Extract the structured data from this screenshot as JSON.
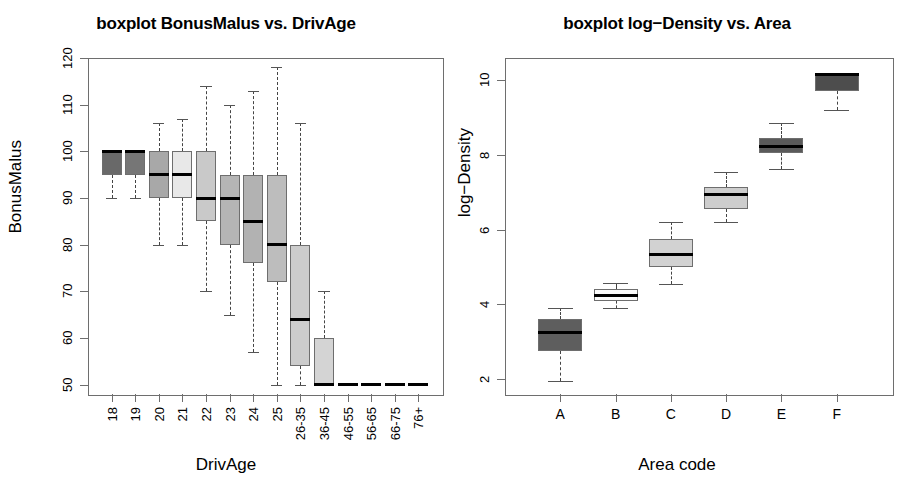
{
  "figure": {
    "panels": [
      "boxplot-bonusmalus-vs-drivage",
      "boxplot-logdensity-vs-area"
    ]
  },
  "chart_data": [
    {
      "type": "box",
      "panel_id": "left",
      "title": "boxplot BonusMalus vs. DrivAge",
      "xlabel": "DrivAge",
      "ylabel": "BonusMalus",
      "ylim": [
        48,
        120
      ],
      "yticks": [
        50,
        60,
        70,
        80,
        90,
        100,
        110,
        120
      ],
      "ytick_labels": [
        "50",
        "60",
        "70",
        "80",
        "90",
        "100",
        "110",
        "120"
      ],
      "grid": false,
      "legend": "none",
      "categories": [
        "18",
        "19",
        "20",
        "21",
        "22",
        "23",
        "24",
        "25",
        "26-35",
        "36-45",
        "46-55",
        "56-65",
        "66-75",
        "76+"
      ],
      "boxes": [
        {
          "category": "18",
          "lower_whisker": 90,
          "q1": 95,
          "median": 100,
          "q3": 100,
          "upper_whisker": 100,
          "fill": "#696969"
        },
        {
          "category": "19",
          "lower_whisker": 90,
          "q1": 95,
          "median": 100,
          "q3": 100,
          "upper_whisker": 100,
          "fill": "#767676"
        },
        {
          "category": "20",
          "lower_whisker": 80,
          "q1": 90,
          "median": 95,
          "q3": 100,
          "upper_whisker": 106,
          "fill": "#a8a8a8"
        },
        {
          "category": "21",
          "lower_whisker": 80,
          "q1": 90,
          "median": 95,
          "q3": 100,
          "upper_whisker": 107,
          "fill": "#e8e8e8"
        },
        {
          "category": "22",
          "lower_whisker": 70,
          "q1": 85,
          "median": 90,
          "q3": 100,
          "upper_whisker": 114,
          "fill": "#c9c9c9"
        },
        {
          "category": "23",
          "lower_whisker": 65,
          "q1": 80,
          "median": 90,
          "q3": 95,
          "upper_whisker": 110,
          "fill": "#b5b5b5"
        },
        {
          "category": "24",
          "lower_whisker": 57,
          "q1": 76,
          "median": 85,
          "q3": 95,
          "upper_whisker": 113,
          "fill": "#b2b2b2"
        },
        {
          "category": "25",
          "lower_whisker": 50,
          "q1": 72,
          "median": 80,
          "q3": 95,
          "upper_whisker": 118,
          "fill": "#bdbdbd"
        },
        {
          "category": "26-35",
          "lower_whisker": 50,
          "q1": 54,
          "median": 64,
          "q3": 80,
          "upper_whisker": 106,
          "fill": "#cccccc"
        },
        {
          "category": "36-45",
          "lower_whisker": 50,
          "q1": 50,
          "median": 50,
          "q3": 60,
          "upper_whisker": 70,
          "fill": "#d4d4d4"
        },
        {
          "category": "46-55",
          "lower_whisker": 50,
          "q1": 50,
          "median": 50,
          "q3": 50,
          "upper_whisker": 50,
          "fill": "#000000"
        },
        {
          "category": "56-65",
          "lower_whisker": 50,
          "q1": 50,
          "median": 50,
          "q3": 50,
          "upper_whisker": 50,
          "fill": "#000000"
        },
        {
          "category": "66-75",
          "lower_whisker": 50,
          "q1": 50,
          "median": 50,
          "q3": 50,
          "upper_whisker": 50,
          "fill": "#000000"
        },
        {
          "category": "76+",
          "lower_whisker": 50,
          "q1": 50,
          "median": 50,
          "q3": 50,
          "upper_whisker": 50,
          "fill": "#000000"
        }
      ]
    },
    {
      "type": "box",
      "panel_id": "right",
      "title": "boxplot log−Density vs. Area",
      "xlabel": "Area code",
      "ylabel": "log−Density",
      "ylim": [
        1.6,
        10.6
      ],
      "yticks": [
        2,
        4,
        6,
        8,
        10
      ],
      "ytick_labels": [
        "2",
        "4",
        "6",
        "8",
        "10"
      ],
      "grid": false,
      "legend": "none",
      "categories": [
        "A",
        "B",
        "C",
        "D",
        "E",
        "F"
      ],
      "boxes": [
        {
          "category": "A",
          "lower_whisker": 1.95,
          "q1": 2.75,
          "median": 3.25,
          "q3": 3.6,
          "upper_whisker": 3.9,
          "fill": "#5e5e5e"
        },
        {
          "category": "B",
          "lower_whisker": 3.9,
          "q1": 4.1,
          "median": 4.25,
          "q3": 4.42,
          "upper_whisker": 4.58,
          "fill": "#fbfbfb"
        },
        {
          "category": "C",
          "lower_whisker": 4.55,
          "q1": 5.0,
          "median": 5.35,
          "q3": 5.75,
          "upper_whisker": 6.2,
          "fill": "#d2d2d2"
        },
        {
          "category": "D",
          "lower_whisker": 6.2,
          "q1": 6.55,
          "median": 6.95,
          "q3": 7.15,
          "upper_whisker": 7.55,
          "fill": "#cdcdcd"
        },
        {
          "category": "E",
          "lower_whisker": 7.62,
          "q1": 8.05,
          "median": 8.22,
          "q3": 8.45,
          "upper_whisker": 8.85,
          "fill": "#5a5a5a"
        },
        {
          "category": "F",
          "lower_whisker": 9.2,
          "q1": 9.72,
          "median": 10.15,
          "q3": 10.18,
          "upper_whisker": 10.2,
          "fill": "#4d4d4d"
        }
      ]
    }
  ]
}
